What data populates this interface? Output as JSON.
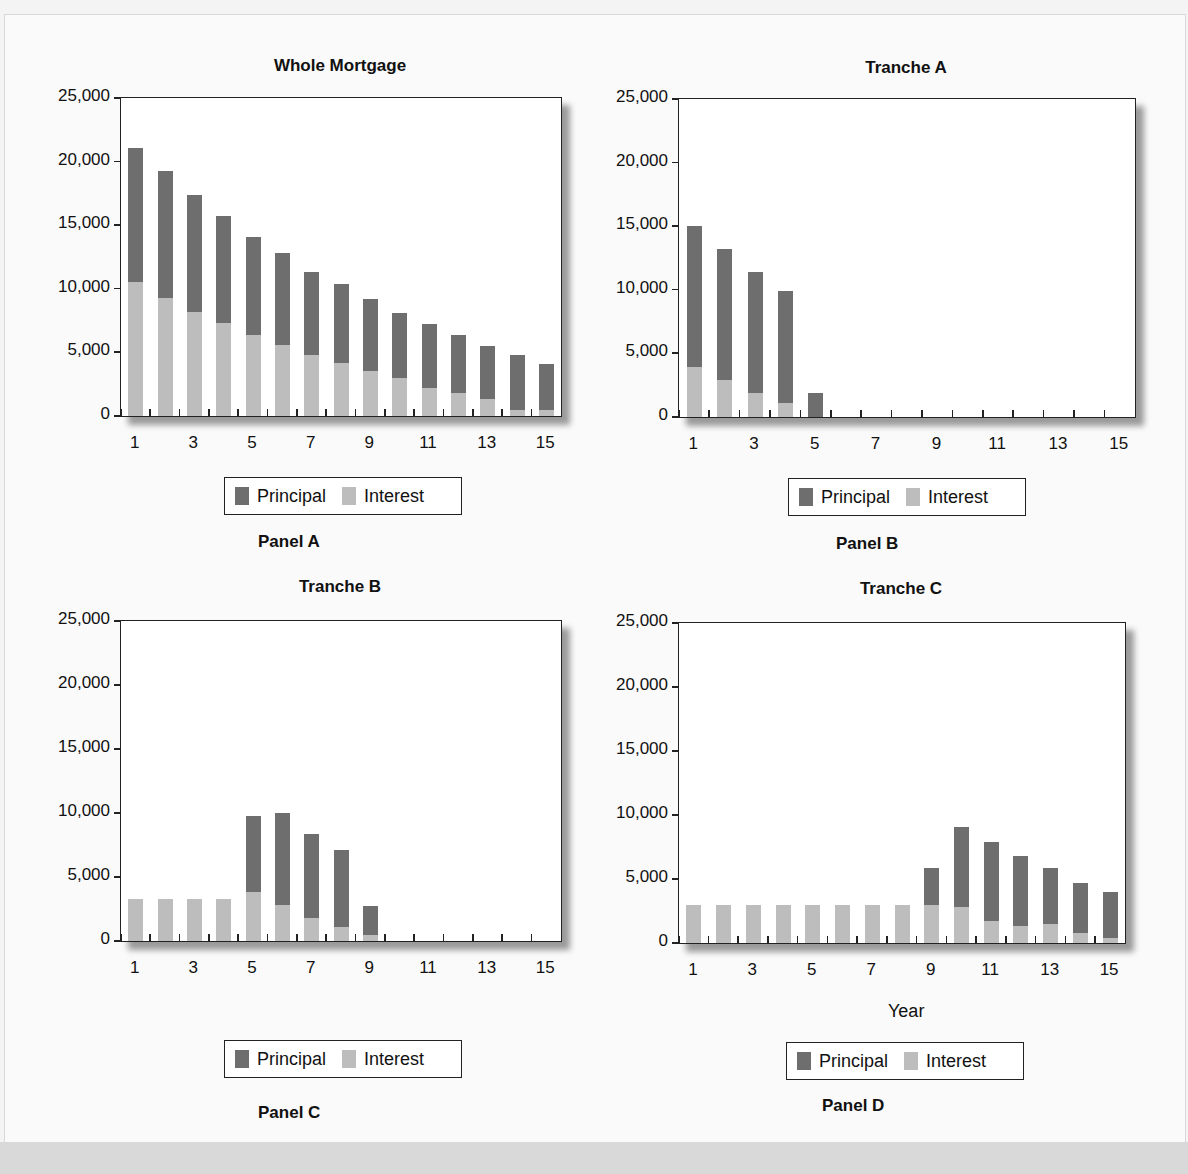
{
  "figure": {
    "legend": {
      "principal": "Principal",
      "interest": "Interest"
    },
    "colors": {
      "principal": "#6e6e6e",
      "interest": "#bdbdbd"
    },
    "x_axis_label": "Year"
  },
  "chart_data": [
    {
      "type": "bar",
      "stacked": true,
      "panel": "Panel A",
      "title": "Whole Mortgage",
      "categories": [
        1,
        2,
        3,
        4,
        5,
        6,
        7,
        8,
        9,
        10,
        11,
        12,
        13,
        14,
        15
      ],
      "x_tick_labels": [
        "1",
        "3",
        "5",
        "7",
        "9",
        "11",
        "13",
        "15"
      ],
      "y_tick_labels": [
        "0",
        "5,000",
        "10,000",
        "15,000",
        "20,000",
        "25,000"
      ],
      "ylim": [
        0,
        25000
      ],
      "series": [
        {
          "name": "Interest",
          "values": [
            10500,
            9300,
            8200,
            7300,
            6400,
            5600,
            4800,
            4200,
            3500,
            3000,
            2200,
            1800,
            1300,
            500,
            500
          ]
        },
        {
          "name": "Principal",
          "values": [
            10600,
            10000,
            9200,
            8400,
            7700,
            7200,
            6500,
            6200,
            5700,
            5100,
            5000,
            4600,
            4200,
            4300,
            3600
          ]
        }
      ],
      "legend": [
        "Principal",
        "Interest"
      ],
      "legend_position": "bottom"
    },
    {
      "type": "bar",
      "stacked": true,
      "panel": "Panel B",
      "title": "Tranche A",
      "categories": [
        1,
        2,
        3,
        4,
        5,
        6,
        7,
        8,
        9,
        10,
        11,
        12,
        13,
        14,
        15
      ],
      "x_tick_labels": [
        "1",
        "3",
        "5",
        "7",
        "9",
        "11",
        "13",
        "15"
      ],
      "y_tick_labels": [
        "0",
        "5,000",
        "10,000",
        "15,000",
        "20,000",
        "25,000"
      ],
      "ylim": [
        0,
        25000
      ],
      "series": [
        {
          "name": "Interest",
          "values": [
            3900,
            2900,
            1900,
            1100,
            0,
            0,
            0,
            0,
            0,
            0,
            0,
            0,
            0,
            0,
            0
          ]
        },
        {
          "name": "Principal",
          "values": [
            11100,
            10300,
            9500,
            8800,
            1900,
            0,
            0,
            0,
            0,
            0,
            0,
            0,
            0,
            0,
            0
          ]
        }
      ],
      "legend": [
        "Principal",
        "Interest"
      ],
      "legend_position": "bottom"
    },
    {
      "type": "bar",
      "stacked": true,
      "panel": "Panel C",
      "title": "Tranche B",
      "categories": [
        1,
        2,
        3,
        4,
        5,
        6,
        7,
        8,
        9,
        10,
        11,
        12,
        13,
        14,
        15
      ],
      "x_tick_labels": [
        "1",
        "3",
        "5",
        "7",
        "9",
        "11",
        "13",
        "15"
      ],
      "y_tick_labels": [
        "0",
        "5,000",
        "10,000",
        "15,000",
        "20,000",
        "25,000"
      ],
      "ylim": [
        0,
        25000
      ],
      "series": [
        {
          "name": "Interest",
          "values": [
            3300,
            3300,
            3300,
            3300,
            3800,
            2800,
            1800,
            1100,
            500,
            0,
            0,
            0,
            0,
            0,
            0
          ]
        },
        {
          "name": "Principal",
          "values": [
            0,
            0,
            0,
            0,
            6000,
            7200,
            6600,
            6000,
            2200,
            0,
            0,
            0,
            0,
            0,
            0
          ]
        }
      ],
      "legend": [
        "Principal",
        "Interest"
      ],
      "legend_position": "bottom"
    },
    {
      "type": "bar",
      "stacked": true,
      "panel": "Panel D",
      "title": "Tranche C",
      "xlabel": "Year",
      "categories": [
        1,
        2,
        3,
        4,
        5,
        6,
        7,
        8,
        9,
        10,
        11,
        12,
        13,
        14,
        15
      ],
      "x_tick_labels": [
        "1",
        "3",
        "5",
        "7",
        "9",
        "11",
        "13",
        "15"
      ],
      "y_tick_labels": [
        "0",
        "5,000",
        "10,000",
        "15,000",
        "20,000",
        "25,000"
      ],
      "ylim": [
        0,
        25000
      ],
      "series": [
        {
          "name": "Interest",
          "values": [
            3000,
            3000,
            3000,
            3000,
            3000,
            3000,
            3000,
            3000,
            3000,
            2800,
            1700,
            1300,
            1500,
            800,
            400
          ]
        },
        {
          "name": "Principal",
          "values": [
            0,
            0,
            0,
            0,
            0,
            0,
            0,
            0,
            2900,
            6300,
            6200,
            5500,
            4400,
            3900,
            3600
          ]
        }
      ],
      "legend": [
        "Principal",
        "Interest"
      ],
      "legend_position": "bottom"
    }
  ]
}
